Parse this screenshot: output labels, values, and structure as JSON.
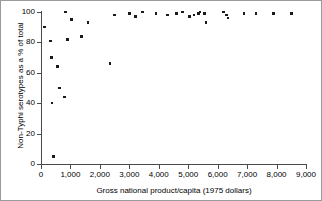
{
  "figure": {
    "background_color": "#ffffff",
    "border_color": "#9a9a9a",
    "point_color": "#1a1a1a",
    "axis_color": "#4a4a4a"
  },
  "chart_data": {
    "type": "scatter",
    "title": "",
    "xlabel": "Gross national product/capita (1975 dollars)",
    "ylabel": "Non-Typhi serotypes as a % of total",
    "xlim": [
      0,
      9000
    ],
    "ylim": [
      0,
      100
    ],
    "xticks": [
      0,
      1000,
      2000,
      3000,
      4000,
      5000,
      6000,
      7000,
      8000,
      9000
    ],
    "xticklabels": [
      "0",
      "1,000",
      "2,000",
      "3,000",
      "4,000",
      "5,000",
      "6,000",
      "7,000",
      "8,000",
      "9,000"
    ],
    "yticks": [
      0,
      20,
      40,
      60,
      80,
      100
    ],
    "yticklabels": [
      "0",
      "20",
      "40",
      "60",
      "80",
      "100"
    ],
    "grid": false,
    "legend": "none",
    "marker": "square",
    "points": [
      {
        "x": 120,
        "y": 90
      },
      {
        "x": 330,
        "y": 81
      },
      {
        "x": 360,
        "y": 70
      },
      {
        "x": 380,
        "y": 40
      },
      {
        "x": 420,
        "y": 5
      },
      {
        "x": 560,
        "y": 64
      },
      {
        "x": 620,
        "y": 50
      },
      {
        "x": 800,
        "y": 44
      },
      {
        "x": 840,
        "y": 100
      },
      {
        "x": 900,
        "y": 82
      },
      {
        "x": 1030,
        "y": 95
      },
      {
        "x": 1380,
        "y": 84
      },
      {
        "x": 1600,
        "y": 93
      },
      {
        "x": 2350,
        "y": 66
      },
      {
        "x": 2500,
        "y": 98
      },
      {
        "x": 3000,
        "y": 99
      },
      {
        "x": 3200,
        "y": 97
      },
      {
        "x": 3450,
        "y": 100
      },
      {
        "x": 3900,
        "y": 99
      },
      {
        "x": 4300,
        "y": 98
      },
      {
        "x": 4600,
        "y": 99
      },
      {
        "x": 4800,
        "y": 100
      },
      {
        "x": 5050,
        "y": 97
      },
      {
        "x": 5200,
        "y": 98
      },
      {
        "x": 5350,
        "y": 99
      },
      {
        "x": 5400,
        "y": 100
      },
      {
        "x": 5550,
        "y": 99
      },
      {
        "x": 5600,
        "y": 93
      },
      {
        "x": 6200,
        "y": 100
      },
      {
        "x": 6300,
        "y": 98
      },
      {
        "x": 6350,
        "y": 96
      },
      {
        "x": 6900,
        "y": 99
      },
      {
        "x": 7300,
        "y": 99
      },
      {
        "x": 7900,
        "y": 99
      },
      {
        "x": 8500,
        "y": 99
      }
    ]
  }
}
